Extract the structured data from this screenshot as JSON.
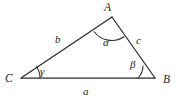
{
  "figure": {
    "kind": "geometry-diagram",
    "shape": "triangle",
    "background_color": "#ffffff",
    "stroke_color": "#2b2b2b",
    "text_color": "#1c1c1c",
    "width": 176,
    "height": 100
  },
  "vertices": [
    {
      "key": "A",
      "label": "A",
      "x": 112,
      "y": 17,
      "label_x": 108,
      "label_y": 11
    },
    {
      "key": "B",
      "label": "B",
      "x": 155,
      "y": 78,
      "label_x": 166,
      "label_y": 82
    },
    {
      "key": "C",
      "label": "C",
      "x": 21,
      "y": 78,
      "label_x": 8,
      "label_y": 81
    }
  ],
  "sides": [
    {
      "key": "a",
      "label": "a",
      "from": "C",
      "to": "B",
      "label_x": 84,
      "label_y": 94
    },
    {
      "key": "b",
      "label": "b",
      "from": "C",
      "to": "A",
      "label_x": 56,
      "label_y": 42
    },
    {
      "key": "c",
      "label": "c",
      "from": "A",
      "to": "B",
      "label_x": 137,
      "label_y": 43
    }
  ],
  "angles": [
    {
      "key": "alpha",
      "label": "α",
      "at_vertex": "A",
      "radius": 22,
      "label_x": 105,
      "label_y": 45
    },
    {
      "key": "beta",
      "label": "β",
      "at_vertex": "B",
      "radius": 17,
      "label_x": 131,
      "label_y": 68
    },
    {
      "key": "gamma",
      "label": "γ",
      "at_vertex": "C",
      "radius": 19,
      "label_x": 41,
      "label_y": 75
    }
  ]
}
